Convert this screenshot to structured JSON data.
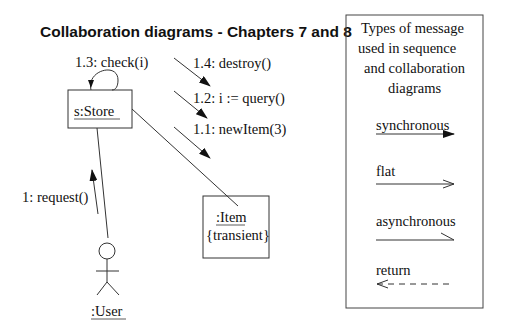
{
  "title": "Collaboration diagrams - Chapters 7 and 8",
  "objects": {
    "store": {
      "name": "s:Store"
    },
    "item": {
      "name": ":Item",
      "constraint": "{transient}"
    },
    "user": {
      "name": ":User"
    }
  },
  "messages": {
    "m1": "1: request()",
    "m11": "1.1: newItem(3)",
    "m12": "1.2: i := query()",
    "m13": "1.3: check(i)",
    "m14": "1.4: destroy()"
  },
  "legend": {
    "heading": [
      "Types of message",
      "used in sequence",
      "and collaboration",
      "diagrams"
    ],
    "items": [
      {
        "label": "synchronous",
        "arrow": "filled-arrow"
      },
      {
        "label": "flat",
        "arrow": "open-arrow"
      },
      {
        "label": "asynchronous",
        "arrow": "half-arrow"
      },
      {
        "label": "return",
        "arrow": "dashed-open-arrow"
      }
    ]
  }
}
